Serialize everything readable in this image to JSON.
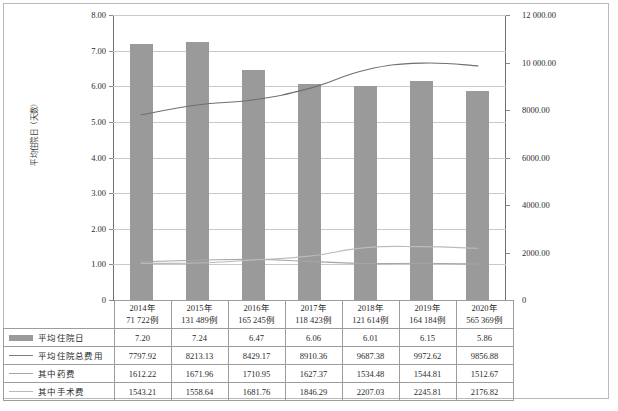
{
  "chart_data": {
    "type": "bar",
    "title": "",
    "xlabel": "",
    "ylabel": "平均住院日（天数）",
    "ylabel_right": "",
    "categories": [
      "2014年",
      "2015年",
      "2016年",
      "2017年",
      "2018年",
      "2019年",
      "2020年"
    ],
    "category_sublabels": [
      "71 722例",
      "131 489例",
      "165 245例",
      "118 423例",
      "121 614例",
      "164 184例",
      "565 369例"
    ],
    "ylim": [
      0,
      8
    ],
    "ylim_right": [
      0,
      12000
    ],
    "yticks": [
      "0",
      "1.00",
      "2.00",
      "3.00",
      "4.00",
      "5.00",
      "6.00",
      "7.00",
      "8.00"
    ],
    "ytick_values": [
      0,
      1,
      2,
      3,
      4,
      5,
      6,
      7,
      8
    ],
    "yticks_right": [
      "0",
      "2000.00",
      "4000.00",
      "6000.00",
      "8000.00",
      "10 000.00",
      "12 000.00"
    ],
    "ytick_values_right": [
      0,
      2000,
      4000,
      6000,
      8000,
      10000,
      12000
    ],
    "grid": true,
    "legend_position": "bottom-table",
    "series": [
      {
        "name": "平均住院日",
        "kind": "bar",
        "axis": "left",
        "color": "#9a9a9a",
        "values": [
          7.2,
          7.24,
          6.47,
          6.06,
          6.01,
          6.15,
          5.86
        ]
      },
      {
        "name": "平均住院总费用",
        "kind": "line",
        "axis": "right",
        "color": "#6f6f6f",
        "values": [
          7797.92,
          8213.13,
          8429.17,
          8910.36,
          9687.38,
          9972.62,
          9856.88
        ]
      },
      {
        "name": "其中药费",
        "kind": "line",
        "axis": "right",
        "color": "#a6a6a6",
        "values": [
          1612.22,
          1671.96,
          1710.95,
          1627.37,
          1534.48,
          1544.81,
          1512.67
        ]
      },
      {
        "name": "其中手术费",
        "kind": "line",
        "axis": "right",
        "color": "#bcbcbc",
        "values": [
          1543.21,
          1558.64,
          1681.76,
          1846.29,
          2207.03,
          2245.81,
          2176.82
        ]
      }
    ]
  },
  "table": {
    "row_labels": [
      "平均住院日",
      "平均住院总费用",
      "其中药费",
      "其中手术费"
    ],
    "rows": [
      [
        "7.20",
        "7.24",
        "6.47",
        "6.06",
        "6.01",
        "6.15",
        "5.86"
      ],
      [
        "7797.92",
        "8213.13",
        "8429.17",
        "8910.36",
        "9687.38",
        "9972.62",
        "9856.88"
      ],
      [
        "1612.22",
        "1671.96",
        "1710.95",
        "1627.37",
        "1534.48",
        "1544.81",
        "1512.67"
      ],
      [
        "1543.21",
        "1558.64",
        "1681.76",
        "1846.29",
        "2207.03",
        "2245.81",
        "2176.82"
      ]
    ]
  },
  "colors": {
    "bar": "#9a9a9a",
    "line_total": "#6f6f6f",
    "line_drug": "#a6a6a6",
    "line_surgery": "#bcbcbc",
    "grid": "#c9c9c9",
    "axis": "#6f6f6f",
    "border": "#9d9d9d"
  }
}
